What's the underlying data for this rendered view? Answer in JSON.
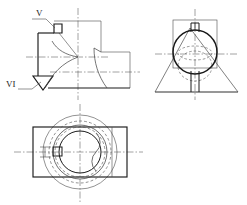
{
  "drawing": {
    "title": "Orthographic engineering drawing of a rotary valve body",
    "background_color": "#ffffff",
    "line_color": "#1a1a1a",
    "thin_line_color": "#4a4a4a",
    "center_line_color": "#555555",
    "hidden_line_color": "#555555",
    "labels": {
      "detail_v": "V",
      "detail_vi": "VI"
    },
    "views": [
      {
        "name": "front-view",
        "label": "Front view with detail callouts V and VI",
        "position": "top-left"
      },
      {
        "name": "side-view",
        "label": "Right side view, circular body on trapezoidal base",
        "position": "top-right"
      },
      {
        "name": "top-view",
        "label": "Top view, concentric circles within rectangle",
        "position": "bottom-left"
      }
    ],
    "annotations": [
      {
        "id": "detail-v",
        "text": "V",
        "target": "small square keyway notch at upper left of front view"
      },
      {
        "id": "detail-vi",
        "text": "VI",
        "target": "V-notch groove at lower left of front view"
      }
    ],
    "line_types": {
      "visible": "continuous thick",
      "hidden": "dashed",
      "center": "dash-dot"
    }
  }
}
